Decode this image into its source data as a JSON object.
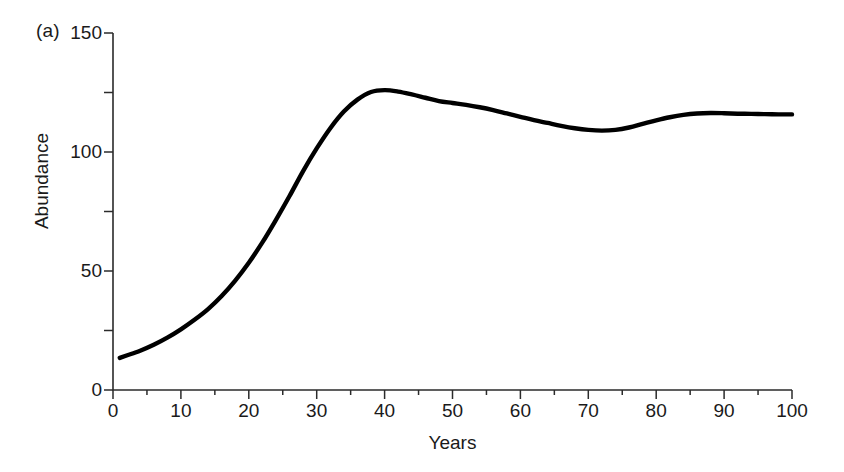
{
  "figure": {
    "panel_label": "(a)",
    "background_color": "#ffffff",
    "curve_color": "#000000",
    "axis_color": "#2b2b2b"
  },
  "chart_data": {
    "type": "line",
    "title": "",
    "subtitle": "",
    "panel": "(a)",
    "xlabel": "Years",
    "ylabel": "Abundance",
    "xlim": [
      0,
      100
    ],
    "ylim": [
      0,
      150
    ],
    "grid": false,
    "legend": null,
    "legend_position": "none",
    "x_major_ticks": [
      0,
      10,
      20,
      30,
      40,
      50,
      60,
      70,
      80,
      90,
      100
    ],
    "x_tick_labels": [
      "0",
      "10",
      "20",
      "30",
      "40",
      "50",
      "60",
      "70",
      "80",
      "90",
      "100"
    ],
    "x_minor_ticks": [
      5,
      15,
      25,
      35,
      45,
      55,
      65,
      75,
      85,
      95
    ],
    "y_major_ticks": [
      0,
      50,
      100,
      150
    ],
    "y_tick_labels": [
      "0",
      "50",
      "100",
      "150"
    ],
    "y_minor_ticks": [
      25,
      75,
      125
    ],
    "series": [
      {
        "name": "Abundance",
        "color": "#000000",
        "line_width": 4.4,
        "x": [
          1,
          2,
          4,
          6,
          8,
          10,
          12,
          14,
          16,
          18,
          20,
          22,
          24,
          26,
          28,
          30,
          32,
          34,
          36,
          38,
          40,
          42,
          44,
          46,
          48,
          50,
          52,
          54,
          56,
          58,
          60,
          62,
          64,
          66,
          68,
          70,
          72,
          74,
          76,
          78,
          80,
          82,
          84,
          86,
          88,
          90,
          92,
          94,
          96,
          98,
          100
        ],
        "values": [
          13.5,
          14.5,
          16.5,
          19.0,
          22.0,
          25.5,
          29.5,
          34.0,
          39.5,
          46.0,
          53.5,
          62.0,
          71.5,
          81.5,
          92.0,
          101.5,
          110.0,
          117.0,
          122.0,
          125.2,
          126.0,
          125.4,
          124.2,
          122.8,
          121.4,
          120.6,
          119.8,
          118.8,
          117.6,
          116.2,
          114.8,
          113.4,
          112.2,
          111.0,
          110.0,
          109.3,
          109.0,
          109.3,
          110.3,
          111.8,
          113.3,
          114.6,
          115.6,
          116.2,
          116.4,
          116.3,
          116.1,
          116.0,
          115.9,
          115.8,
          115.8
        ]
      }
    ],
    "annotations": [
      {
        "name": "peak",
        "x": 39,
        "y": 126.0,
        "text": ""
      },
      {
        "name": "trough",
        "x": 72,
        "y": 109.0,
        "text": ""
      },
      {
        "name": "plateau",
        "x": 100,
        "y": 115.8,
        "text": ""
      }
    ]
  }
}
